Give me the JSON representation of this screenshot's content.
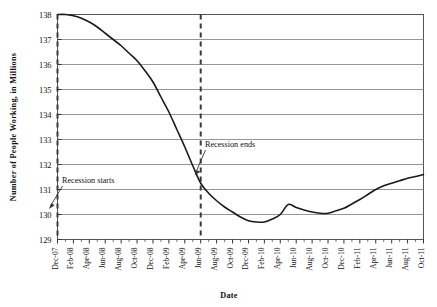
{
  "chart_data": {
    "type": "line",
    "title": "",
    "xlabel": "Date",
    "ylabel": "Number of People Working, in Millions",
    "ylim": [
      129,
      138
    ],
    "yticks": [
      129,
      130,
      131,
      132,
      133,
      134,
      135,
      136,
      137,
      138
    ],
    "grid": true,
    "legend": null,
    "categories": [
      "Dec-07",
      "Feb-08",
      "Apr-08",
      "Jun-08",
      "Aug-08",
      "Oct-08",
      "Dec-08",
      "Feb-09",
      "Apr-09",
      "Jun-09",
      "Aug-09",
      "Oct-09",
      "Dec-09",
      "Feb-10",
      "Apr-10",
      "Jun-10",
      "Aug-10",
      "Oct-10",
      "Dec-10",
      "Feb-11",
      "Apr-11",
      "Jun-11",
      "Aug-11",
      "Oct-11"
    ],
    "x_tick_labels": [
      "Dec-07",
      "Feb-08",
      "Apr-08",
      "Jun-08",
      "Aug-08",
      "Oct-08",
      "Dec-08",
      "Feb-09",
      "Apr-09",
      "Jun-09",
      "Aug-09",
      "Oct-09",
      "Dec-09",
      "Feb-10",
      "Apr-10",
      "Jun-10",
      "Aug-10",
      "Oct-10",
      "Dec-10",
      "Feb-11",
      "Apr-11",
      "Jun-11",
      "Aug-11",
      "Oct-11"
    ],
    "series": [
      {
        "name": "Number of People Working",
        "values": [
          138.0,
          137.95,
          137.7,
          137.25,
          136.75,
          136.15,
          135.3,
          134.1,
          132.7,
          131.25,
          130.55,
          130.1,
          129.75,
          129.7,
          130.0,
          130.4,
          130.1,
          130.05,
          130.25,
          130.6,
          131.0,
          131.25,
          131.45,
          131.6
        ]
      }
    ],
    "monthly_points": [
      {
        "x": "Dec-07",
        "y": 138.0
      },
      {
        "x": "Jan-08",
        "y": 138.0
      },
      {
        "x": "Feb-08",
        "y": 137.95
      },
      {
        "x": "Mar-08",
        "y": 137.85
      },
      {
        "x": "Apr-08",
        "y": 137.7
      },
      {
        "x": "May-08",
        "y": 137.5
      },
      {
        "x": "Jun-08",
        "y": 137.25
      },
      {
        "x": "Jul-08",
        "y": 137.0
      },
      {
        "x": "Aug-08",
        "y": 136.75
      },
      {
        "x": "Sep-08",
        "y": 136.45
      },
      {
        "x": "Oct-08",
        "y": 136.15
      },
      {
        "x": "Nov-08",
        "y": 135.75
      },
      {
        "x": "Dec-08",
        "y": 135.3
      },
      {
        "x": "Jan-09",
        "y": 134.7
      },
      {
        "x": "Feb-09",
        "y": 134.1
      },
      {
        "x": "Mar-09",
        "y": 133.4
      },
      {
        "x": "Apr-09",
        "y": 132.7
      },
      {
        "x": "May-09",
        "y": 131.95
      },
      {
        "x": "Jun-09",
        "y": 131.25
      },
      {
        "x": "Jul-09",
        "y": 130.85
      },
      {
        "x": "Aug-09",
        "y": 130.55
      },
      {
        "x": "Sep-09",
        "y": 130.3
      },
      {
        "x": "Oct-09",
        "y": 130.1
      },
      {
        "x": "Nov-09",
        "y": 129.9
      },
      {
        "x": "Dec-09",
        "y": 129.75
      },
      {
        "x": "Jan-10",
        "y": 129.7
      },
      {
        "x": "Feb-10",
        "y": 129.7
      },
      {
        "x": "Mar-10",
        "y": 129.82
      },
      {
        "x": "Apr-10",
        "y": 130.0
      },
      {
        "x": "May-10",
        "y": 130.4
      },
      {
        "x": "Jun-10",
        "y": 130.28
      },
      {
        "x": "Jul-10",
        "y": 130.18
      },
      {
        "x": "Aug-10",
        "y": 130.1
      },
      {
        "x": "Sep-10",
        "y": 130.05
      },
      {
        "x": "Oct-10",
        "y": 130.05
      },
      {
        "x": "Nov-10",
        "y": 130.15
      },
      {
        "x": "Dec-10",
        "y": 130.25
      },
      {
        "x": "Jan-11",
        "y": 130.42
      },
      {
        "x": "Feb-11",
        "y": 130.6
      },
      {
        "x": "Mar-11",
        "y": 130.8
      },
      {
        "x": "Apr-11",
        "y": 131.0
      },
      {
        "x": "May-11",
        "y": 131.15
      },
      {
        "x": "Jun-11",
        "y": 131.25
      },
      {
        "x": "Jul-11",
        "y": 131.35
      },
      {
        "x": "Aug-11",
        "y": 131.45
      },
      {
        "x": "Sep-11",
        "y": 131.52
      },
      {
        "x": "Oct-11",
        "y": 131.6
      }
    ],
    "annotations": [
      {
        "id": "recession-start",
        "label": "Recession starts",
        "at_x": "Dec-07",
        "marker": "dashed-vertical-line"
      },
      {
        "id": "recession-end",
        "label": "Recession ends",
        "at_x": "Jun-09",
        "marker": "dashed-vertical-line"
      }
    ],
    "colors": {
      "line": "#1a1a1a",
      "grid": "#8a8a8a",
      "axis": "#4d4d4d",
      "annotation": "#333333",
      "background": "#ffffff"
    }
  }
}
